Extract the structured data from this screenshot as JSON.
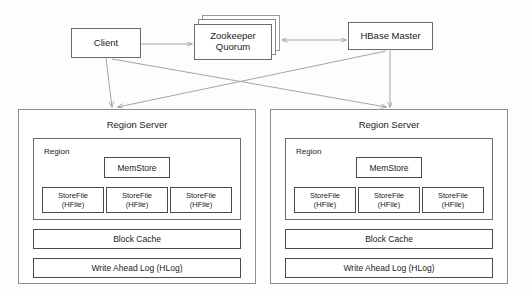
{
  "diagram": {
    "type": "architecture-diagram",
    "background_color": "#fdfdfd",
    "line_color": "#9b9b9b",
    "border_color": "#6b6b6b",
    "text_color": "#1a1a1a"
  },
  "nodes": {
    "client": {
      "label": "Client"
    },
    "zookeeper": {
      "label_line1": "Zookeeper",
      "label_line2": "Quorum",
      "stacked": true
    },
    "hbase_master": {
      "label": "HBase Master"
    }
  },
  "region_servers": [
    {
      "title": "Region Server",
      "region": {
        "label": "Region",
        "memstore": {
          "label": "MemStore"
        },
        "storefiles": [
          {
            "line1": "StoreFile",
            "line2": "(HFile)"
          },
          {
            "line1": "StoreFile",
            "line2": "(HFile)"
          },
          {
            "line1": "StoreFile",
            "line2": "(HFile)"
          }
        ]
      },
      "block_cache": {
        "label": "Block Cache"
      },
      "write_ahead_log": {
        "label": "Write Ahead Log (HLog)"
      }
    },
    {
      "title": "Region Server",
      "region": {
        "label": "Region",
        "memstore": {
          "label": "MemStore"
        },
        "storefiles": [
          {
            "line1": "StoreFile",
            "line2": "(HFile)"
          },
          {
            "line1": "StoreFile",
            "line2": "(HFile)"
          },
          {
            "line1": "StoreFile",
            "line2": "(HFile)"
          }
        ]
      },
      "block_cache": {
        "label": "Block Cache"
      },
      "write_ahead_log": {
        "label": "Write Ahead Log (HLog)"
      }
    }
  ],
  "connections": [
    {
      "from": "client",
      "to": "zookeeper",
      "arrow": "single"
    },
    {
      "from": "zookeeper",
      "to": "hbase_master",
      "arrow": "double"
    },
    {
      "from": "client",
      "to": "region-server-1",
      "arrow": "single"
    },
    {
      "from": "client",
      "to": "region-server-2",
      "arrow": "single"
    },
    {
      "from": "hbase_master",
      "to": "region-server-1",
      "arrow": "single"
    },
    {
      "from": "hbase_master",
      "to": "region-server-2",
      "arrow": "single"
    }
  ]
}
